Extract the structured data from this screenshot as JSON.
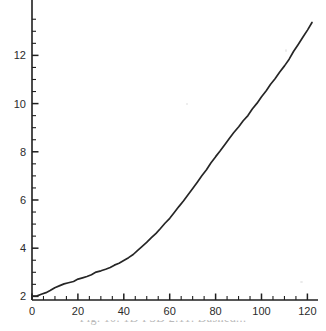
{
  "figure": {
    "background_color": "#ffffff",
    "line_color": "#262626",
    "axis_color": "#1f1f1f",
    "tick_label_color": "#2b2b2b",
    "caption_color": "#b9b9b9"
  },
  "caption": {
    "text": "Fig. 10. 1D PSD 2.11. Dashed...",
    "visible_note": "cropped"
  },
  "chart_data": {
    "type": "line",
    "title": "",
    "xlabel": "",
    "ylabel": "",
    "xlim": [
      0,
      124
    ],
    "ylim": [
      1.85,
      13.8
    ],
    "grid": false,
    "legend": null,
    "x_major_ticks": [
      0,
      20,
      40,
      60,
      80,
      100,
      120
    ],
    "x_tick_labels": [
      "0",
      "20",
      "40",
      "60",
      "80",
      "100",
      "120"
    ],
    "x_minor_step": 5,
    "y_major_ticks": [
      2,
      4,
      6,
      8,
      10,
      12
    ],
    "y_tick_labels": [
      "2",
      "4",
      "6",
      "8",
      "10",
      "12"
    ],
    "y_minor_step": 0.5,
    "series": [
      {
        "name": "curve",
        "color": "#262626",
        "x": [
          0,
          2,
          4,
          6,
          8,
          10,
          12,
          14,
          16,
          18,
          20,
          22,
          24,
          26,
          28,
          30,
          32,
          34,
          36,
          38,
          40,
          42,
          44,
          46,
          48,
          50,
          52,
          54,
          56,
          58,
          60,
          62,
          64,
          66,
          68,
          70,
          72,
          74,
          76,
          78,
          80,
          82,
          84,
          86,
          88,
          90,
          92,
          94,
          96,
          98,
          100,
          102,
          104,
          106,
          108,
          110,
          112,
          114,
          116,
          118,
          120,
          122
        ],
        "y": [
          2.0,
          2.03,
          2.09,
          2.17,
          2.26,
          2.35,
          2.43,
          2.5,
          2.57,
          2.63,
          2.7,
          2.77,
          2.84,
          2.91,
          2.99,
          3.07,
          3.14,
          3.21,
          3.29,
          3.38,
          3.48,
          3.6,
          3.74,
          3.9,
          4.07,
          4.25,
          4.43,
          4.62,
          4.82,
          5.02,
          5.24,
          5.47,
          5.71,
          5.96,
          6.22,
          6.48,
          6.74,
          7.0,
          7.26,
          7.52,
          7.78,
          8.04,
          8.3,
          8.55,
          8.79,
          9.03,
          9.27,
          9.51,
          9.76,
          10.01,
          10.27,
          10.53,
          10.79,
          11.05,
          11.31,
          11.58,
          11.86,
          12.15,
          12.45,
          12.76,
          13.07,
          13.38
        ]
      }
    ]
  },
  "geometry": {
    "plot_left_px": 32,
    "plot_bottom_px": 300,
    "x_scale_px_per_unit": 2.295,
    "y_scale_px_per_unit": 24.1
  }
}
